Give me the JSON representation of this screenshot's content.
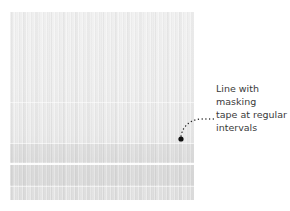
{
  "figure": {
    "colors": {
      "fabric_base": "#ececec",
      "fabric_lower": "#dedede",
      "annotation_text": "#3a3a3a",
      "marker": "#111111"
    }
  },
  "annotation": {
    "label": "Line with masking tape at regular intervals",
    "lines": [
      "Line with masking",
      "tape at regular",
      "intervals"
    ]
  }
}
